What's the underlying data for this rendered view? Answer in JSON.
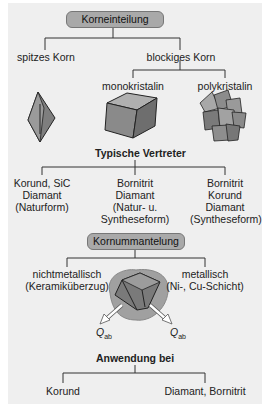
{
  "section1": {
    "header": "Korneinteilung",
    "branches": [
      "spitzes Korn",
      "blockiges Korn"
    ],
    "sub_branches": [
      "monokristalin",
      "polykristalin"
    ],
    "shapes": [
      "spitzes-korn-shape",
      "monokristalin-cube-shape",
      "polykristalin-cluster-shape"
    ],
    "representatives_title": "Typische Vertreter",
    "representatives": [
      [
        "Korund, SiC",
        "Diamant",
        "(Naturform)"
      ],
      [
        "Bornitrit",
        "Diamant",
        "(Natur- u.",
        "Syntheseform)"
      ],
      [
        "Bornitrit",
        "Korund",
        "Diamant",
        "(Syntheseform)"
      ]
    ]
  },
  "section2": {
    "header": "Kornummantelung",
    "branches": [
      [
        "nichtmetallisch",
        "(Keramiküberzug)"
      ],
      [
        "metallisch",
        "(Ni-, Cu-Schicht)"
      ]
    ],
    "arrow_label_left": "Q",
    "arrow_label_left_sub": "ab",
    "arrow_label_right": "Q",
    "arrow_label_right_sub": "ab",
    "application_title": "Anwendung bei",
    "applications": [
      "Korund",
      "Diamant, Bornitrit"
    ]
  },
  "colors": {
    "panel": "#efefef",
    "header_box": "#a9a9a9",
    "shape_fill": "#8a8a8a",
    "coating": "#a0a0a0"
  }
}
